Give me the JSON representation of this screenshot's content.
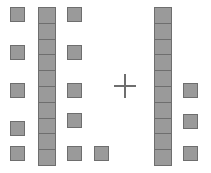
{
  "diagram": {
    "type": "base-ten-blocks-addition",
    "operator_symbol": "+",
    "unit_color": "#9a9a9a",
    "border_color": "#6e6e6e",
    "background_color": "#ffffff",
    "left_addend": {
      "label": "left addend",
      "groups": [
        {
          "name": "unit-column-1",
          "kind": "units",
          "count": 5,
          "x": 10,
          "y": 7,
          "size": 15,
          "step": 38
        },
        {
          "name": "ten-rod-1",
          "kind": "ten-rod",
          "count": 10,
          "x": 38,
          "y": 7,
          "width": 18,
          "height": 159
        },
        {
          "name": "unit-column-2",
          "kind": "units",
          "count": 5,
          "x": 67,
          "y": 7,
          "size": 15,
          "step": 38
        },
        {
          "name": "unit-single",
          "kind": "units",
          "count": 1,
          "x": 94,
          "y": 145,
          "size": 15,
          "step": 38
        }
      ],
      "tens": 1,
      "ones": 11,
      "value": 21
    },
    "right_addend": {
      "label": "right addend",
      "groups": [
        {
          "name": "ten-rod-2",
          "kind": "ten-rod",
          "count": 10,
          "x": 154,
          "y": 7,
          "width": 18,
          "height": 159
        },
        {
          "name": "unit-column-3",
          "kind": "units",
          "count": 3,
          "x": 183,
          "y": 83,
          "size": 15,
          "step": 38
        }
      ],
      "tens": 1,
      "ones": 3,
      "value": 13
    }
  }
}
